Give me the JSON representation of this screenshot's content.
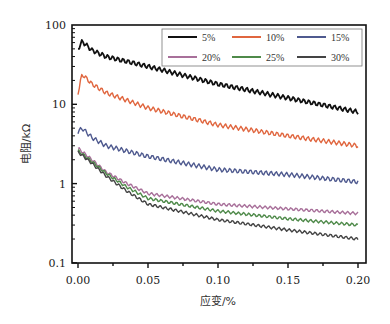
{
  "chart_data": {
    "type": "line",
    "title": "",
    "xlabel": "应变/%",
    "ylabel": "电阻/kΩ",
    "xlim": [
      -0.003,
      0.205
    ],
    "ylim": [
      0.1,
      100
    ],
    "yscale": "log",
    "x_ticks": [
      "0.00",
      "0.05",
      "0.10",
      "0.15",
      "0.20"
    ],
    "x_tick_values": [
      0.0,
      0.05,
      0.1,
      0.15,
      0.2
    ],
    "y_ticks": [
      "0.1",
      "1",
      "10",
      "100"
    ],
    "y_tick_values": [
      0.1,
      1,
      10,
      100
    ],
    "grid": false,
    "legend_position": "upper right, 3 columns",
    "series": [
      {
        "name": "5%",
        "color": "#111111",
        "x": [
          0.0,
          0.003,
          0.01,
          0.02,
          0.05,
          0.1,
          0.15,
          0.2
        ],
        "values": [
          50,
          62,
          48,
          40,
          30,
          18,
          12,
          8
        ]
      },
      {
        "name": "10%",
        "color": "#e0663f",
        "x": [
          0.0,
          0.003,
          0.01,
          0.02,
          0.05,
          0.1,
          0.15,
          0.2
        ],
        "values": [
          14,
          24,
          18,
          14,
          9,
          5.5,
          4,
          3
        ]
      },
      {
        "name": "15%",
        "color": "#4f5a8f",
        "x": [
          0.0,
          0.003,
          0.01,
          0.02,
          0.05,
          0.1,
          0.15,
          0.2
        ],
        "values": [
          4.5,
          5,
          3.8,
          3.0,
          2.2,
          1.5,
          1.3,
          1.05
        ]
      },
      {
        "name": "20%",
        "color": "#a8709a",
        "x": [
          0.0,
          0.01,
          0.02,
          0.035,
          0.05,
          0.1,
          0.15,
          0.2
        ],
        "values": [
          2.8,
          2.0,
          1.4,
          1.0,
          0.75,
          0.55,
          0.48,
          0.42
        ]
      },
      {
        "name": "25%",
        "color": "#4f8a4a",
        "x": [
          0.0,
          0.01,
          0.02,
          0.035,
          0.05,
          0.1,
          0.15,
          0.2
        ],
        "values": [
          2.6,
          1.9,
          1.35,
          0.9,
          0.65,
          0.45,
          0.36,
          0.3
        ]
      },
      {
        "name": "30%",
        "color": "#444444",
        "x": [
          0.0,
          0.01,
          0.02,
          0.035,
          0.05,
          0.1,
          0.15,
          0.2
        ],
        "values": [
          2.5,
          1.8,
          1.25,
          0.8,
          0.55,
          0.35,
          0.26,
          0.2
        ]
      }
    ]
  },
  "axes": {
    "xlabel": "应变/%",
    "ylabel": "电阻/kΩ",
    "x_ticks": [
      "0.00",
      "0.05",
      "0.10",
      "0.15",
      "0.20"
    ],
    "y_ticks": [
      "0.1",
      "1",
      "10",
      "100"
    ]
  },
  "legend": {
    "items": [
      {
        "label": "5%",
        "color": "#111111"
      },
      {
        "label": "10%",
        "color": "#e0663f"
      },
      {
        "label": "15%",
        "color": "#4f5a8f"
      },
      {
        "label": "20%",
        "color": "#a8709a"
      },
      {
        "label": "25%",
        "color": "#4f8a4a"
      },
      {
        "label": "30%",
        "color": "#444444"
      }
    ]
  }
}
